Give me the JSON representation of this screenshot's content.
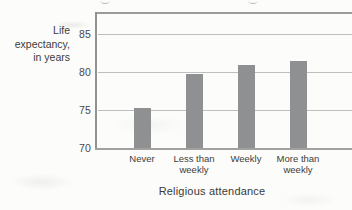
{
  "chart_data": {
    "type": "bar",
    "categories": [
      "Never",
      "Less than weekly",
      "Weekly",
      "More than weekly"
    ],
    "category_lines": [
      [
        "Never"
      ],
      [
        "Less than",
        "weekly"
      ],
      [
        "Weekly"
      ],
      [
        "More than",
        "weekly"
      ]
    ],
    "values": [
      75.3,
      79.7,
      80.9,
      81.5
    ],
    "xlabel": "Religious attendance",
    "ylabel": "Life expectancy, in years",
    "ylabel_lines": [
      "Life",
      "expectancy,",
      "in years"
    ],
    "yticks": [
      70,
      75,
      80,
      85
    ],
    "ylim": [
      70,
      87.8
    ],
    "grid": "horizontal",
    "legend": "none",
    "colors": {
      "bar": "#8f9092",
      "gridline": "#bfbfbd",
      "axis_frame": "#9b9b99",
      "tick_text": "#48484a",
      "label_text": "#3c3c3a",
      "paper": "#fcfcfa"
    }
  }
}
